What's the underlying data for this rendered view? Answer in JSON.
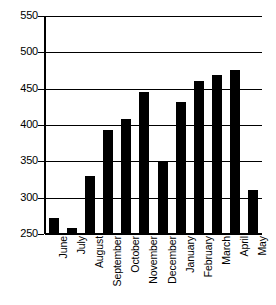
{
  "chart_data": {
    "type": "bar",
    "title": "",
    "subtitle": "",
    "xlabel": "",
    "ylabel": "",
    "categories": [
      "June",
      "July",
      "August",
      "September",
      "October",
      "November",
      "December",
      "January",
      "February",
      "March",
      "April",
      "May"
    ],
    "values": [
      272,
      258,
      330,
      393,
      408,
      445,
      350,
      432,
      461,
      469,
      476,
      310
    ],
    "series": [
      {
        "name": "",
        "values": [
          272,
          258,
          330,
          393,
          408,
          445,
          350,
          432,
          461,
          469,
          476,
          310
        ]
      }
    ],
    "ylim": [
      250,
      550
    ],
    "yticks": [
      250,
      300,
      350,
      400,
      450,
      500,
      550
    ],
    "ytick_labels": [
      "250",
      "300",
      "350",
      "400",
      "450",
      "500",
      "550"
    ],
    "grid": true,
    "grid_axis": "y",
    "legend": false,
    "legend_position": "none",
    "bar_color": "#000000",
    "background_color": "#ffffff",
    "axis_color": "#000000",
    "annotations": []
  }
}
